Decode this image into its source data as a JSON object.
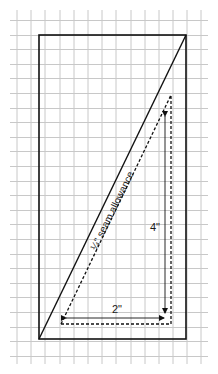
{
  "diagram": {
    "grid": {
      "color": "#c8c8c8",
      "x_lines": [
        17,
        31,
        45,
        60,
        74,
        88,
        102,
        116,
        131,
        145,
        159,
        173,
        187,
        201
      ],
      "y_start": 20,
      "y_step": 14.6,
      "y_count": 25,
      "x_min": 10,
      "x_max": 208,
      "y_min": 10,
      "y_max": 364
    },
    "rectangle": {
      "x": 39,
      "y": 35,
      "width": 147,
      "height": 304,
      "stroke": "#111111"
    },
    "diagonal": {
      "x1": 39,
      "y1": 339,
      "x2": 186,
      "y2": 35,
      "stroke": "#111111"
    },
    "seam_triangle": {
      "points": [
        [
          61,
          324
        ],
        [
          171,
          324
        ],
        [
          171,
          95
        ]
      ],
      "stroke": "#111111",
      "dash": "3,2"
    },
    "arrows": {
      "width_arrow": {
        "x1": 66,
        "y1": 318,
        "x2": 164,
        "y2": 318
      },
      "height_arrow": {
        "x1": 165,
        "y1": 116,
        "x2": 165,
        "y2": 313
      }
    },
    "labels": {
      "seam": "¼\" seam allowance",
      "height": "4\"",
      "width": "2\""
    }
  }
}
